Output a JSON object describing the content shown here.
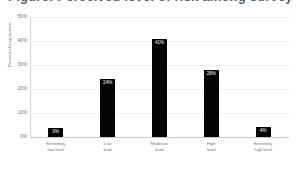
{
  "chart_data": {
    "type": "bar",
    "title": "Figure: Perceived level of risk among survey respondents",
    "xlabel": "",
    "ylabel": "Percent of respondents",
    "categories": [
      "Extremely low level",
      "Low level",
      "Moderate level",
      "High level",
      "Extremely high level"
    ],
    "category_lines": [
      [
        "Extremely",
        "low level"
      ],
      [
        "Low",
        "level"
      ],
      [
        "Moderate",
        "level"
      ],
      [
        "High",
        "level"
      ],
      [
        "Extremely",
        "high level"
      ]
    ],
    "values": [
      0,
      24,
      41,
      28,
      4
    ],
    "data_labels": [
      "0%",
      "24%",
      "41%",
      "28%",
      "4%"
    ],
    "ylim": [
      0,
      50
    ],
    "yticks": [
      50,
      40,
      30,
      20,
      10,
      0
    ],
    "ytick_labels": [
      "50%",
      "40%",
      "30%",
      "20%",
      "10%",
      "0%"
    ],
    "grid": true,
    "legend": false,
    "bar_color": "#050505",
    "label_color": "#ffffff"
  }
}
